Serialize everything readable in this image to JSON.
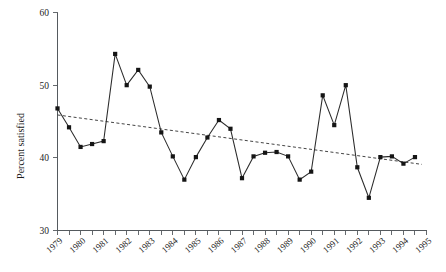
{
  "chart_data": {
    "type": "line",
    "title": "",
    "subtitle": "",
    "xlabel": "",
    "ylabel": "Percent satisfied",
    "ylim": [
      30,
      60
    ],
    "xlim": [
      1979,
      1995
    ],
    "yticks": [
      30,
      40,
      50,
      60
    ],
    "ytick_labels": [
      "30",
      "40",
      "50",
      "60"
    ],
    "xtick_labels": [
      "1979",
      "1980",
      "1981",
      "1982",
      "1983",
      "1984",
      "1985",
      "1986",
      "1987",
      "1988",
      "1989",
      "1990",
      "1991",
      "1992",
      "1993",
      "1994",
      "1995"
    ],
    "grid": false,
    "legend": "none",
    "marker": "filled-square",
    "x": [
      1979.0,
      1979.5,
      1980.0,
      1980.5,
      1981.0,
      1981.5,
      1982.0,
      1982.5,
      1983.0,
      1983.5,
      1984.0,
      1984.5,
      1985.0,
      1985.5,
      1986.0,
      1986.5,
      1987.0,
      1987.5,
      1988.0,
      1988.5,
      1989.0,
      1989.5,
      1990.0,
      1990.5,
      1991.0,
      1991.5,
      1992.0,
      1992.5,
      1993.0,
      1993.5,
      1994.0,
      1994.5
    ],
    "values": [
      46.8,
      44.2,
      41.5,
      41.9,
      42.3,
      54.3,
      50.0,
      52.1,
      49.8,
      43.5,
      40.2,
      37.0,
      40.1,
      42.8,
      45.2,
      44.0,
      37.2,
      40.2,
      40.7,
      40.8,
      40.2,
      37.0,
      38.1,
      48.6,
      44.5,
      50.0,
      38.7,
      34.5,
      40.1,
      40.2,
      39.2,
      40.1
    ],
    "series": [
      {
        "name": "Percent satisfied",
        "style": "solid-with-markers",
        "values": [
          46.8,
          44.2,
          41.5,
          41.9,
          42.3,
          54.3,
          50.0,
          52.1,
          49.8,
          43.5,
          40.2,
          37.0,
          40.1,
          42.8,
          45.2,
          44.0,
          37.2,
          40.2,
          40.7,
          40.8,
          40.2,
          37.0,
          38.1,
          48.6,
          44.5,
          50.0,
          38.7,
          34.5,
          40.1,
          40.2,
          39.2,
          40.1
        ]
      },
      {
        "name": "Linear trend",
        "style": "dashed",
        "x": [
          1979.0,
          1994.8
        ],
        "values": [
          45.9,
          39.1
        ]
      }
    ],
    "annotations": []
  },
  "axes": {
    "y_axis_label": "Percent satisfied",
    "y_tick_top": "60",
    "y_tick_mid_high": "50",
    "y_tick_mid_low": "40",
    "y_tick_bottom": "30"
  }
}
